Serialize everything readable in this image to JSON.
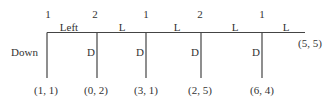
{
  "diagram": {
    "type": "extensive-form game tree (centipede)",
    "stroke_color": "#444444",
    "text_color": "#333333",
    "nodes": [
      {
        "player": "1",
        "x": 47,
        "continue_label": "Left",
        "stop_label": "Down",
        "payoff": "(1, 1)"
      },
      {
        "player": "2",
        "x": 97,
        "continue_label": "L",
        "stop_label": "D",
        "payoff": "(0, 2)"
      },
      {
        "player": "1",
        "x": 146,
        "continue_label": "L",
        "stop_label": "D",
        "payoff": "(3, 1)"
      },
      {
        "player": "2",
        "x": 201,
        "continue_label": "L",
        "stop_label": "D",
        "payoff": "(2, 5)"
      },
      {
        "player": "1",
        "x": 262,
        "continue_label": "L",
        "stop_label": "D",
        "payoff": "(6, 4)"
      }
    ],
    "terminal_payoff": "(5, 5)"
  }
}
